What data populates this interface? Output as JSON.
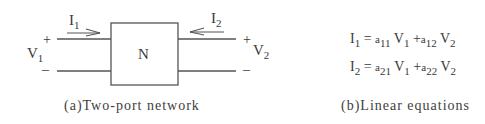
{
  "diagram": {
    "network": {
      "box_label": "N",
      "left_port": {
        "current_symbol": "I",
        "current_sub": "1",
        "voltage_symbol": "V",
        "voltage_sub": "1",
        "plus": "+",
        "minus": "–"
      },
      "right_port": {
        "current_symbol": "I",
        "current_sub": "2",
        "voltage_symbol": "V",
        "voltage_sub": "2",
        "plus": "+",
        "minus": "–"
      },
      "caption": "(a)Two-port network"
    },
    "equations": {
      "lines": [
        {
          "lhs": "I",
          "lhs_sub": "1",
          "eq": "=",
          "c1": "a",
          "c1_sub": "11",
          "v1": "V",
          "v1_sub": "1",
          "plus": "+",
          "c2": "a",
          "c2_sub": "12",
          "v2": "V",
          "v2_sub": "2"
        },
        {
          "lhs": "I",
          "lhs_sub": "2",
          "eq": "=",
          "c1": "a",
          "c1_sub": "21",
          "v1": "V",
          "v1_sub": "1",
          "plus": "+",
          "c2": "a",
          "c2_sub": "22",
          "v2": "V",
          "v2_sub": "2"
        }
      ],
      "caption": "(b)Linear equations"
    },
    "colors": {
      "line": "#555555",
      "text": "#3a3a3a",
      "background": "#ffffff"
    }
  }
}
